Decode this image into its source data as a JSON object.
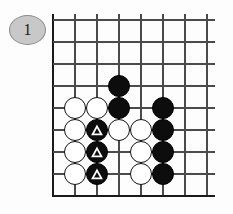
{
  "diagram": {
    "kind": "go-board-problem",
    "label": {
      "text": "1",
      "shape": "ellipse",
      "fill_color": "#c8c8c8",
      "border_color": "#8a8a8a"
    },
    "board": {
      "background_color": "#fdfdfd",
      "line_color": "#4a4a4a",
      "edge_color": "#1a1a1a",
      "columns": 8,
      "rows": 9,
      "origin_x": 53,
      "origin_y": 20,
      "spacing": 22,
      "left_edge_thick": true,
      "bottom_edge_thick": true,
      "top_open": true,
      "right_open": true
    },
    "stone_colors": {
      "black": "#0d0d0d",
      "white": "#ffffff",
      "white_border": "#111111",
      "mark": "#ffffff"
    },
    "stone_radius": 11,
    "stones": [
      {
        "col": 3,
        "row": 3,
        "color": "black",
        "mark": "none"
      },
      {
        "col": 3,
        "row": 4,
        "color": "black",
        "mark": "none"
      },
      {
        "col": 1,
        "row": 4,
        "color": "white",
        "mark": "none"
      },
      {
        "col": 2,
        "row": 4,
        "color": "white",
        "mark": "none"
      },
      {
        "col": 5,
        "row": 4,
        "color": "black",
        "mark": "none"
      },
      {
        "col": 1,
        "row": 5,
        "color": "white",
        "mark": "none"
      },
      {
        "col": 2,
        "row": 5,
        "color": "black",
        "mark": "triangle"
      },
      {
        "col": 3,
        "row": 5,
        "color": "white",
        "mark": "none"
      },
      {
        "col": 4,
        "row": 5,
        "color": "white",
        "mark": "none"
      },
      {
        "col": 5,
        "row": 5,
        "color": "black",
        "mark": "none"
      },
      {
        "col": 1,
        "row": 6,
        "color": "white",
        "mark": "none"
      },
      {
        "col": 2,
        "row": 6,
        "color": "black",
        "mark": "triangle"
      },
      {
        "col": 4,
        "row": 6,
        "color": "white",
        "mark": "none"
      },
      {
        "col": 5,
        "row": 6,
        "color": "black",
        "mark": "none"
      },
      {
        "col": 1,
        "row": 7,
        "color": "white",
        "mark": "none"
      },
      {
        "col": 2,
        "row": 7,
        "color": "black",
        "mark": "triangle"
      },
      {
        "col": 4,
        "row": 7,
        "color": "white",
        "mark": "none"
      },
      {
        "col": 5,
        "row": 7,
        "color": "black",
        "mark": "none"
      }
    ]
  }
}
